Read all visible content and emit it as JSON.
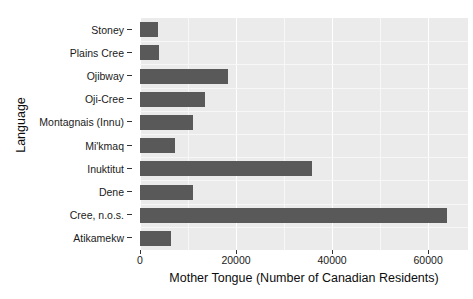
{
  "top_ghost_text": "",
  "chart_data": {
    "type": "bar",
    "orientation": "horizontal",
    "title": "",
    "xlabel": "Mother Tongue (Number of Canadian Residents)",
    "ylabel": "Language",
    "categories": [
      "Stoney",
      "Plains Cree",
      "Ojibway",
      "Oji-Cree",
      "Montagnais (Innu)",
      "Mi'kmaq",
      "Inuktitut",
      "Dene",
      "Cree, n.o.s.",
      "Atikamekw"
    ],
    "values": [
      3700,
      3900,
      18300,
      13500,
      11000,
      7300,
      35800,
      11000,
      64000,
      6500
    ],
    "xlim": [
      0,
      68300
    ],
    "xticks": [
      0,
      20000,
      40000,
      60000
    ],
    "xticklabels": [
      "0",
      "20000",
      "40000",
      "60000"
    ],
    "grid": true,
    "legend": "none",
    "bar_color": "#595959",
    "panel_color": "#ebebeb",
    "gridline_color": "#ffffff"
  }
}
